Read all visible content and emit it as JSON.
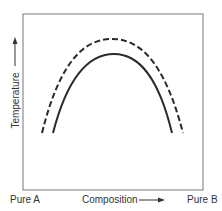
{
  "diagram": {
    "type": "phase-diagram",
    "y_axis_label": "Temperature",
    "x_axis_label": "Composition",
    "x_left_label": "Pure A",
    "x_right_label": "Pure B",
    "curves": [
      {
        "name": "upper-curve",
        "style": "dashed",
        "shape": "inverted-parabola"
      },
      {
        "name": "lower-curve",
        "style": "solid",
        "shape": "inverted-parabola"
      }
    ],
    "colors": {
      "line": "#2a2a2a",
      "frame": "#777777",
      "background": "#ffffff"
    }
  }
}
